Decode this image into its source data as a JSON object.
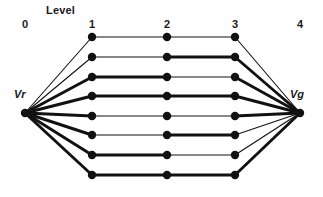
{
  "figure": {
    "title_text": "Level",
    "background": "#ffffff",
    "ink_color": "#111111",
    "width": 323,
    "height": 197
  },
  "levels": [
    {
      "label": "0",
      "x": 25,
      "label_x": 16,
      "label_y": 18
    },
    {
      "label": "1",
      "x": 92,
      "label_x": 83,
      "label_y": 18
    },
    {
      "label": "2",
      "x": 167,
      "label_x": 158,
      "label_y": 18
    },
    {
      "label": "3",
      "x": 235,
      "label_x": 226,
      "label_y": 18
    },
    {
      "label": "4",
      "x": 300,
      "label_x": 291,
      "label_y": 18
    }
  ],
  "header": {
    "text": "Level",
    "x": 46,
    "y": 4
  },
  "terminals": {
    "source": {
      "name": "Vr",
      "x": 25,
      "y": 113,
      "label_x": 14,
      "label_y": 88,
      "radius": 4.2
    },
    "sink": {
      "name": "Vg",
      "x": 300,
      "y": 113,
      "label_x": 290,
      "label_y": 88,
      "radius": 4.2
    }
  },
  "columns": {
    "level1_x": 92,
    "level2_x": 167,
    "level3_x": 235
  },
  "node_radius": 4.2,
  "stroke_thin": 1.1,
  "stroke_thick": 2.9,
  "rows": [
    {
      "y": 37,
      "seg12": "thin",
      "seg23": "thin",
      "in": "thin",
      "out": "thin"
    },
    {
      "y": 57,
      "seg12": "thin",
      "seg23": "thick",
      "in": "thin",
      "out": "thick"
    },
    {
      "y": 77,
      "seg12": "thick",
      "seg23": "thin",
      "in": "thick",
      "out": "thick"
    },
    {
      "y": 96,
      "seg12": "thick",
      "seg23": "thick",
      "in": "thick",
      "out": "thick"
    },
    {
      "y": 116,
      "seg12": "thin",
      "seg23": "thin",
      "in": "thick",
      "out": "thick"
    },
    {
      "y": 135,
      "seg12": "thin",
      "seg23": "thick",
      "in": "thick",
      "out": "thin"
    },
    {
      "y": 155,
      "seg12": "thick",
      "seg23": "thin",
      "in": "thick",
      "out": "thin"
    },
    {
      "y": 175,
      "seg12": "thick",
      "seg23": "thick",
      "in": "thick",
      "out": "thick"
    }
  ],
  "chart_data": {
    "type": "diagram",
    "title": "Level",
    "level_labels": [
      "0",
      "1",
      "2",
      "3",
      "4"
    ],
    "source_node": "Vr",
    "sink_node": "Vg",
    "path_count": 8,
    "nodes_per_path": 3,
    "edge_weights": [
      {
        "path": 1,
        "Vr-1": "thin",
        "1-2": "thin",
        "2-3": "thin",
        "3-Vg": "thin"
      },
      {
        "path": 2,
        "Vr-1": "thin",
        "1-2": "thin",
        "2-3": "thick",
        "3-Vg": "thick"
      },
      {
        "path": 3,
        "Vr-1": "thick",
        "1-2": "thick",
        "2-3": "thin",
        "3-Vg": "thick"
      },
      {
        "path": 4,
        "Vr-1": "thick",
        "1-2": "thick",
        "2-3": "thick",
        "3-Vg": "thick"
      },
      {
        "path": 5,
        "Vr-1": "thick",
        "1-2": "thin",
        "2-3": "thin",
        "3-Vg": "thick"
      },
      {
        "path": 6,
        "Vr-1": "thick",
        "1-2": "thin",
        "2-3": "thick",
        "3-Vg": "thin"
      },
      {
        "path": 7,
        "Vr-1": "thick",
        "1-2": "thick",
        "2-3": "thin",
        "3-Vg": "thin"
      },
      {
        "path": 8,
        "Vr-1": "thick",
        "1-2": "thick",
        "2-3": "thick",
        "3-Vg": "thick"
      }
    ]
  }
}
